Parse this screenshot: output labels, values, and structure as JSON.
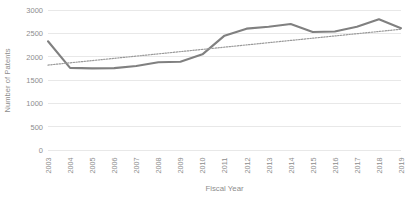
{
  "chart_data": {
    "type": "line",
    "title": "",
    "xlabel": "Fiscal Year",
    "ylabel": "Number of Patents",
    "categories": [
      "2003",
      "2004",
      "2005",
      "2006",
      "2007",
      "2008",
      "2009",
      "2010",
      "2011",
      "2012",
      "2013",
      "2014",
      "2015",
      "2016",
      "2017",
      "2018",
      "2019"
    ],
    "series": [
      {
        "name": "Number of Patents",
        "style": "solid",
        "color": "#808080",
        "values": [
          2330,
          1760,
          1750,
          1755,
          1800,
          1880,
          1890,
          2050,
          2450,
          2600,
          2640,
          2700,
          2530,
          2540,
          2640,
          2800,
          2610
        ]
      },
      {
        "name": "Linear trendline",
        "style": "dotted",
        "color": "#9a9a9a",
        "values": [
          1820,
          1868,
          1916,
          1964,
          2012,
          2060,
          2108,
          2156,
          2204,
          2252,
          2300,
          2348,
          2396,
          2444,
          2492,
          2540,
          2588
        ]
      }
    ],
    "ylim": [
      0,
      3000
    ],
    "yticks": [
      0,
      500,
      1000,
      1500,
      2000,
      2500,
      3000
    ],
    "ytick_labels": [
      "0",
      "500",
      "1000",
      "1500",
      "2000",
      "2500",
      "3000"
    ],
    "grid": "horizontal",
    "gridline_color": "#e8e8e8",
    "legend": "none",
    "background": "#ffffff"
  }
}
